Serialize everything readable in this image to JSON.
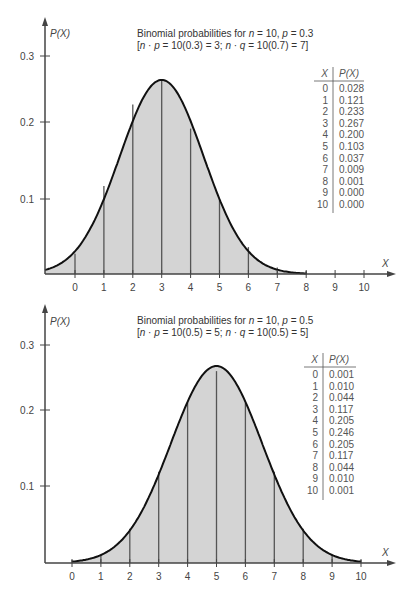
{
  "chart_data": [
    {
      "type": "bar",
      "title": "Binomial probabilities for n = 10, p = 0.3",
      "subtitle": "[n · p = 10(0.3) = 3; n · q = 10(0.7) = 7]",
      "xlabel": "X",
      "ylabel": "P(X)",
      "categories": [
        0,
        1,
        2,
        3,
        4,
        5,
        6,
        7,
        8,
        9,
        10
      ],
      "values": [
        0.028,
        0.121,
        0.233,
        0.267,
        0.2,
        0.103,
        0.037,
        0.009,
        0.001,
        0.0,
        0.0
      ],
      "yticks": [
        "0.1",
        "0.2",
        "0.3"
      ],
      "ylim": [
        0,
        0.35
      ],
      "grid": false,
      "overlay": "normal approximation curve (mean 3), shaded area",
      "table": {
        "headers": [
          "X",
          "P(X)"
        ],
        "rows": [
          [
            "0",
            "0.028"
          ],
          [
            "1",
            "0.121"
          ],
          [
            "2",
            "0.233"
          ],
          [
            "3",
            "0.267"
          ],
          [
            "4",
            "0.200"
          ],
          [
            "5",
            "0.103"
          ],
          [
            "6",
            "0.037"
          ],
          [
            "7",
            "0.009"
          ],
          [
            "8",
            "0.001"
          ],
          [
            "9",
            "0.000"
          ],
          [
            "10",
            "0.000"
          ]
        ]
      }
    },
    {
      "type": "bar",
      "title": "Binomial probabilities for n = 10, p = 0.5",
      "subtitle": "[n · p = 10(0.5) = 5; n · q = 10(0.5) = 5]",
      "xlabel": "X",
      "ylabel": "P(X)",
      "categories": [
        0,
        1,
        2,
        3,
        4,
        5,
        6,
        7,
        8,
        9,
        10
      ],
      "values": [
        0.001,
        0.01,
        0.044,
        0.117,
        0.205,
        0.246,
        0.205,
        0.117,
        0.044,
        0.01,
        0.001
      ],
      "yticks": [
        "0.1",
        "0.2",
        "0.3"
      ],
      "ylim": [
        0,
        0.35
      ],
      "grid": false,
      "overlay": "normal approximation curve (mean 5), shaded area",
      "table": {
        "headers": [
          "X",
          "P(X)"
        ],
        "rows": [
          [
            "0",
            "0.001"
          ],
          [
            "1",
            "0.010"
          ],
          [
            "2",
            "0.044"
          ],
          [
            "3",
            "0.117"
          ],
          [
            "4",
            "0.205"
          ],
          [
            "5",
            "0.246"
          ],
          [
            "6",
            "0.205"
          ],
          [
            "7",
            "0.117"
          ],
          [
            "8",
            "0.044"
          ],
          [
            "9",
            "0.010"
          ],
          [
            "10",
            "0.001"
          ]
        ]
      }
    }
  ],
  "charts": [
    {
      "title_prefix": "Binomial probabilities for ",
      "n_label": "n",
      "n_eq": " = 10, ",
      "p_label": "p",
      "p_eq": " = 0.3",
      "sub_open": "[",
      "sub_n": "n",
      "sub_dot": " · ",
      "sub_p": "p",
      "sub_mid": " = 10(0.3) = 3; ",
      "sub_n2": "n",
      "sub_dot2": " · ",
      "sub_q": "q",
      "sub_end": " = 10(0.7) = 7]",
      "ylabel": "P(X)",
      "xlabel": "X",
      "yticks": [
        "0.3",
        "0.2",
        "0.1"
      ],
      "xticks": [
        "0",
        "1",
        "2",
        "3",
        "4",
        "5",
        "6",
        "7",
        "8",
        "9",
        "10"
      ],
      "table_h1": "X",
      "table_h2": "P(X)"
    },
    {
      "title_prefix": "Binomial probabilities for ",
      "n_label": "n",
      "n_eq": " = 10, ",
      "p_label": "p",
      "p_eq": " = 0.5",
      "sub_open": "[",
      "sub_n": "n",
      "sub_dot": " · ",
      "sub_p": "p",
      "sub_mid": " = 10(0.5) = 5; ",
      "sub_n2": "n",
      "sub_dot2": " · ",
      "sub_q": "q",
      "sub_end": " = 10(0.5) = 5]",
      "ylabel": "P(X)",
      "xlabel": "X",
      "yticks": [
        "0.3",
        "0.2",
        "0.1"
      ],
      "xticks": [
        "0",
        "1",
        "2",
        "3",
        "4",
        "5",
        "6",
        "7",
        "8",
        "9",
        "10"
      ],
      "table_h1": "X",
      "table_h2": "P(X)"
    }
  ],
  "colors": {
    "fill": "#d4d4d4",
    "curve": "#111111",
    "axis": "#444444",
    "bar_line": "#555555"
  }
}
